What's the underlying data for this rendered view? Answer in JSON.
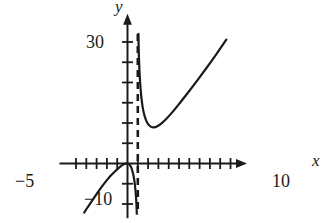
{
  "figure": {
    "kind": "cartesian-graph",
    "width": 328,
    "height": 223,
    "background_color": "#ffffff",
    "ink_color": "#1a1a1a"
  },
  "labels": {
    "y_axis": "y",
    "x_axis": "x",
    "y_tick_30": "30",
    "y_tick_neg10": "−10",
    "x_tick_neg5": "−5",
    "x_tick_10": "10"
  },
  "chart_data": {
    "type": "line",
    "title": "",
    "xlabel": "x",
    "ylabel": "y",
    "xlim": [
      -6.6,
      11.6
    ],
    "ylim": [
      -13.5,
      37
    ],
    "grid": false,
    "legend": null,
    "axis": {
      "x_tick_interval": 1,
      "x_labeled_ticks": [
        {
          "x": -5,
          "label": "−5"
        },
        {
          "x": 10,
          "label": "10"
        }
      ],
      "x_tick_values": [
        -5,
        -4,
        -3,
        -2,
        -1,
        0,
        1,
        2,
        3,
        4,
        5,
        6,
        7,
        8,
        9,
        10
      ],
      "y_tick_interval": 5,
      "y_labeled_ticks": [
        {
          "y": 30,
          "label": "30"
        },
        {
          "y": -10,
          "label": "−10"
        }
      ],
      "y_tick_values": [
        -10,
        -5,
        5,
        10,
        15,
        20,
        25,
        30
      ],
      "x_arrow": "right",
      "y_arrow": "up"
    },
    "annotations": [
      {
        "kind": "vertical-asymptote",
        "x": 1,
        "style": "dashed",
        "y_from": -12.5,
        "y_to": 32
      }
    ],
    "series": [
      {
        "name": "left-branch",
        "style": "solid",
        "comment": "rises from lower-left, local max at origin, plunges to −∞ at x=1",
        "points": [
          [
            -4.2,
            -12.1
          ],
          [
            -4.0,
            -11.3
          ],
          [
            -3.6,
            -9.8
          ],
          [
            -3.2,
            -8.3
          ],
          [
            -2.8,
            -6.8
          ],
          [
            -2.4,
            -5.4
          ],
          [
            -2.0,
            -4.1
          ],
          [
            -1.6,
            -2.9
          ],
          [
            -1.2,
            -1.9
          ],
          [
            -0.9,
            -1.2
          ],
          [
            -0.6,
            -0.6
          ],
          [
            -0.35,
            -0.2
          ],
          [
            -0.15,
            -0.03
          ],
          [
            0.0,
            0.0
          ],
          [
            0.12,
            -0.1
          ],
          [
            0.25,
            -0.45
          ],
          [
            0.38,
            -1.1
          ],
          [
            0.5,
            -2.1
          ],
          [
            0.6,
            -3.2
          ],
          [
            0.68,
            -4.5
          ],
          [
            0.75,
            -6.0
          ],
          [
            0.8,
            -7.4
          ],
          [
            0.84,
            -8.8
          ],
          [
            0.87,
            -10.2
          ],
          [
            0.89,
            -11.4
          ],
          [
            0.9,
            -12.4
          ]
        ]
      },
      {
        "name": "right-branch",
        "style": "solid",
        "comment": "drops from +∞ at x=1, minimum near (2.2, 9), then rises",
        "points": [
          [
            1.06,
            32.0
          ],
          [
            1.08,
            29.0
          ],
          [
            1.12,
            25.5
          ],
          [
            1.18,
            22.0
          ],
          [
            1.26,
            18.8
          ],
          [
            1.36,
            16.0
          ],
          [
            1.48,
            13.8
          ],
          [
            1.62,
            12.1
          ],
          [
            1.8,
            10.7
          ],
          [
            2.0,
            9.7
          ],
          [
            2.25,
            9.1
          ],
          [
            2.55,
            8.9
          ],
          [
            2.9,
            9.2
          ],
          [
            3.3,
            9.9
          ],
          [
            3.8,
            11.1
          ],
          [
            4.4,
            12.8
          ],
          [
            5.1,
            15.0
          ],
          [
            5.9,
            17.6
          ],
          [
            6.8,
            20.6
          ],
          [
            7.7,
            23.7
          ],
          [
            8.6,
            26.9
          ],
          [
            9.2,
            29.1
          ],
          [
            9.6,
            30.6
          ]
        ]
      }
    ]
  }
}
